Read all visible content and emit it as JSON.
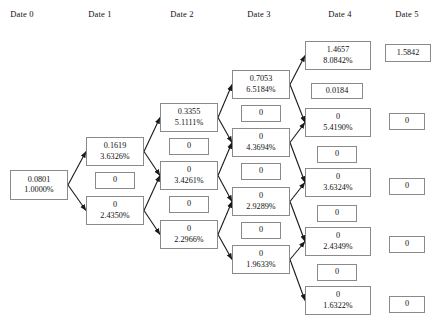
{
  "figure": {
    "type": "binomial-lattice",
    "headers": [
      {
        "label": "Date 0",
        "cx": 22
      },
      {
        "label": "Date 1",
        "cx": 100
      },
      {
        "label": "Date 2",
        "cx": 182
      },
      {
        "label": "Date 3",
        "cx": 259
      },
      {
        "label": "Date 4",
        "cx": 340
      },
      {
        "label": "Date 5",
        "cx": 407
      }
    ],
    "nodes": [
      {
        "id": "d0n0",
        "date": 0,
        "value": "0.0801",
        "rate": "1.0000%",
        "x": 10,
        "y": 170,
        "w": 58,
        "h": 30,
        "kind": "pair"
      },
      {
        "id": "d1n0",
        "date": 1,
        "value": "0.1619",
        "rate": "3.6326%",
        "x": 86,
        "y": 137,
        "w": 58,
        "h": 29,
        "kind": "pair"
      },
      {
        "id": "d1z0",
        "date": 1,
        "value": "0",
        "rate": "",
        "x": 95,
        "y": 172,
        "w": 40,
        "h": 17,
        "kind": "single"
      },
      {
        "id": "d1n1",
        "date": 1,
        "value": "0",
        "rate": "2.4350%",
        "x": 86,
        "y": 196,
        "w": 58,
        "h": 29,
        "kind": "pair"
      },
      {
        "id": "d2n0",
        "date": 2,
        "value": "0.3355",
        "rate": "5.1111%",
        "x": 160,
        "y": 103,
        "w": 58,
        "h": 29,
        "kind": "pair"
      },
      {
        "id": "d2z0",
        "date": 2,
        "value": "0",
        "rate": "",
        "x": 169,
        "y": 138,
        "w": 40,
        "h": 17,
        "kind": "single"
      },
      {
        "id": "d2n1",
        "date": 2,
        "value": "0",
        "rate": "3.4261%",
        "x": 160,
        "y": 161,
        "w": 58,
        "h": 29,
        "kind": "pair"
      },
      {
        "id": "d2z1",
        "date": 2,
        "value": "0",
        "rate": "",
        "x": 169,
        "y": 196,
        "w": 40,
        "h": 17,
        "kind": "single"
      },
      {
        "id": "d2n2",
        "date": 2,
        "value": "0",
        "rate": "2.2966%",
        "x": 160,
        "y": 220,
        "w": 58,
        "h": 29,
        "kind": "pair"
      },
      {
        "id": "d3n0",
        "date": 3,
        "value": "0.7053",
        "rate": "6.5184%",
        "x": 232,
        "y": 70,
        "w": 58,
        "h": 29,
        "kind": "pair"
      },
      {
        "id": "d3z0",
        "date": 3,
        "value": "0",
        "rate": "",
        "x": 241,
        "y": 105,
        "w": 40,
        "h": 17,
        "kind": "single"
      },
      {
        "id": "d3n1",
        "date": 3,
        "value": "0",
        "rate": "4.3694%",
        "x": 232,
        "y": 128,
        "w": 58,
        "h": 29,
        "kind": "pair"
      },
      {
        "id": "d3z1",
        "date": 3,
        "value": "0",
        "rate": "",
        "x": 241,
        "y": 163,
        "w": 40,
        "h": 17,
        "kind": "single"
      },
      {
        "id": "d3n2",
        "date": 3,
        "value": "0",
        "rate": "2.9289%",
        "x": 232,
        "y": 187,
        "w": 58,
        "h": 29,
        "kind": "pair"
      },
      {
        "id": "d3z2",
        "date": 3,
        "value": "0",
        "rate": "",
        "x": 241,
        "y": 222,
        "w": 40,
        "h": 17,
        "kind": "single"
      },
      {
        "id": "d3n3",
        "date": 3,
        "value": "0",
        "rate": "1.9633%",
        "x": 232,
        "y": 245,
        "w": 58,
        "h": 29,
        "kind": "pair"
      },
      {
        "id": "d4n0",
        "date": 4,
        "value": "1.4657",
        "rate": "8.0842%",
        "x": 305,
        "y": 41,
        "w": 66,
        "h": 29,
        "kind": "pair"
      },
      {
        "id": "d4z0",
        "date": 4,
        "value": "0.0184",
        "rate": "",
        "x": 311,
        "y": 83,
        "w": 52,
        "h": 16,
        "kind": "single"
      },
      {
        "id": "d4n1",
        "date": 4,
        "value": "0",
        "rate": "5.4190%",
        "x": 305,
        "y": 108,
        "w": 66,
        "h": 29,
        "kind": "pair"
      },
      {
        "id": "d4z1",
        "date": 4,
        "value": "0",
        "rate": "",
        "x": 317,
        "y": 146,
        "w": 40,
        "h": 17,
        "kind": "single"
      },
      {
        "id": "d4n2",
        "date": 4,
        "value": "0",
        "rate": "3.6324%",
        "x": 305,
        "y": 168,
        "w": 66,
        "h": 29,
        "kind": "pair"
      },
      {
        "id": "d4z2",
        "date": 4,
        "value": "0",
        "rate": "",
        "x": 317,
        "y": 205,
        "w": 40,
        "h": 17,
        "kind": "single"
      },
      {
        "id": "d4n3",
        "date": 4,
        "value": "0",
        "rate": "2.4349%",
        "x": 305,
        "y": 227,
        "w": 66,
        "h": 29,
        "kind": "pair"
      },
      {
        "id": "d4z3",
        "date": 4,
        "value": "0",
        "rate": "",
        "x": 317,
        "y": 264,
        "w": 40,
        "h": 17,
        "kind": "single"
      },
      {
        "id": "d4n4",
        "date": 4,
        "value": "0",
        "rate": "1.6322%",
        "x": 305,
        "y": 286,
        "w": 66,
        "h": 29,
        "kind": "pair"
      },
      {
        "id": "d5n0",
        "date": 5,
        "value": "1.5842",
        "rate": "",
        "x": 385,
        "y": 44,
        "w": 46,
        "h": 18,
        "kind": "single"
      },
      {
        "id": "d5n1",
        "date": 5,
        "value": "0",
        "rate": "",
        "x": 389,
        "y": 113,
        "w": 36,
        "h": 17,
        "kind": "single"
      },
      {
        "id": "d5n2",
        "date": 5,
        "value": "0",
        "rate": "",
        "x": 389,
        "y": 178,
        "w": 36,
        "h": 17,
        "kind": "single"
      },
      {
        "id": "d5n3",
        "date": 5,
        "value": "0",
        "rate": "",
        "x": 389,
        "y": 236,
        "w": 36,
        "h": 17,
        "kind": "single"
      },
      {
        "id": "d5n4",
        "date": 5,
        "value": "0",
        "rate": "",
        "x": 389,
        "y": 296,
        "w": 36,
        "h": 17,
        "kind": "single"
      }
    ],
    "edges": [
      {
        "from": "d0n0",
        "to": "d1n0"
      },
      {
        "from": "d0n0",
        "to": "d1n1"
      },
      {
        "from": "d1n0",
        "to": "d2n0"
      },
      {
        "from": "d1n0",
        "to": "d2n1"
      },
      {
        "from": "d1n1",
        "to": "d2n1"
      },
      {
        "from": "d1n1",
        "to": "d2n2"
      },
      {
        "from": "d2n0",
        "to": "d3n0"
      },
      {
        "from": "d2n0",
        "to": "d3n1"
      },
      {
        "from": "d2n1",
        "to": "d3n1"
      },
      {
        "from": "d2n1",
        "to": "d3n2"
      },
      {
        "from": "d2n2",
        "to": "d3n2"
      },
      {
        "from": "d2n2",
        "to": "d3n3"
      },
      {
        "from": "d3n0",
        "to": "d4n0"
      },
      {
        "from": "d3n0",
        "to": "d4n1"
      },
      {
        "from": "d3n1",
        "to": "d4n1"
      },
      {
        "from": "d3n1",
        "to": "d4n2"
      },
      {
        "from": "d3n2",
        "to": "d4n2"
      },
      {
        "from": "d3n2",
        "to": "d4n3"
      },
      {
        "from": "d3n3",
        "to": "d4n3"
      },
      {
        "from": "d3n3",
        "to": "d4n4"
      }
    ],
    "colors": {
      "box_border": "#8a8a8a",
      "text": "#111111",
      "edge": "#1a1a1a",
      "background": "#ffffff"
    }
  }
}
